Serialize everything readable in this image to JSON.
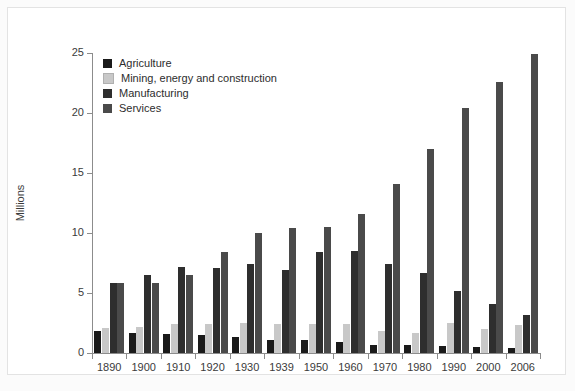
{
  "chart_data": {
    "type": "bar",
    "title": "",
    "subtitle": "",
    "xlabel": "",
    "ylabel": "Millions",
    "ylim": [
      0,
      25
    ],
    "yticks": [
      0,
      5,
      10,
      15,
      20,
      25
    ],
    "grid": false,
    "legend_position": "top-left inside",
    "categories": [
      "1890",
      "1900",
      "1910",
      "1920",
      "1930",
      "1939",
      "1950",
      "1960",
      "1970",
      "1980",
      "1990",
      "2000",
      "2006"
    ],
    "series": [
      {
        "name": "Agriculture",
        "color": "#1a1a1a",
        "values": [
          1.8,
          1.7,
          1.6,
          1.5,
          1.3,
          1.1,
          1.1,
          0.9,
          0.7,
          0.7,
          0.6,
          0.5,
          0.4
        ]
      },
      {
        "name": "Mining, energy and construction",
        "color": "#c8c8c8",
        "values": [
          2.1,
          2.2,
          2.4,
          2.4,
          2.5,
          2.4,
          2.4,
          2.4,
          1.8,
          1.7,
          2.5,
          2.0,
          2.3
        ]
      },
      {
        "name": "Manufacturing",
        "color": "#2e2e2e",
        "values": [
          5.8,
          6.5,
          7.2,
          7.1,
          7.4,
          6.9,
          8.4,
          8.5,
          7.4,
          6.7,
          5.2,
          4.1,
          3.2
        ]
      },
      {
        "name": "Services",
        "color": "#4a4a4a",
        "values": [
          5.8,
          5.8,
          6.5,
          8.4,
          10.0,
          10.4,
          10.5,
          11.6,
          14.1,
          17.0,
          20.4,
          22.6,
          24.9
        ]
      }
    ]
  },
  "legend": {
    "items": [
      {
        "label": "Agriculture",
        "color": "#1a1a1a"
      },
      {
        "label": "Mining, energy and construction",
        "color": "#c8c8c8"
      },
      {
        "label": "Manufacturing",
        "color": "#2e2e2e"
      },
      {
        "label": "Services",
        "color": "#4a4a4a"
      }
    ]
  },
  "axes": {
    "y_label": "Millions",
    "y_tick_labels": [
      "0",
      "5",
      "10",
      "15",
      "20",
      "25"
    ],
    "x_tick_labels": [
      "1890",
      "1900",
      "1910",
      "1920",
      "1930",
      "1939",
      "1950",
      "1960",
      "1970",
      "1980",
      "1990",
      "2000",
      "2006"
    ]
  }
}
